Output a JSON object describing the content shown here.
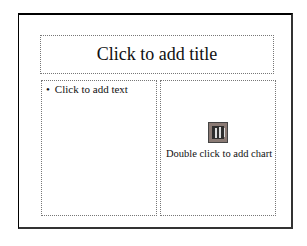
{
  "slide": {
    "title_placeholder": "Click to add title",
    "text_placeholder": {
      "bullet": "•",
      "label": "Click to add text"
    },
    "chart_placeholder": {
      "icon": "chart-icon",
      "label": "Double click to add chart"
    }
  }
}
